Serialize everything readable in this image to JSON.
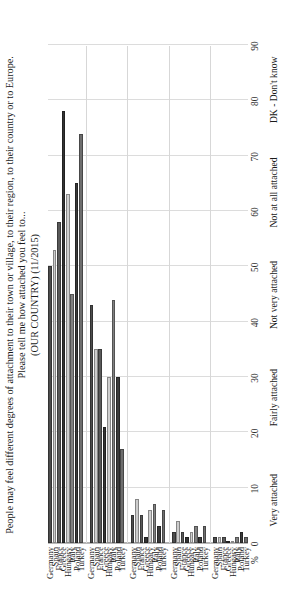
{
  "figure": {
    "title_line1": "People may feel different degrees of attachment to their town or village, to their region, to their country or to Europe.",
    "title_line2": "Please tell me how attached you feel to...",
    "title_line3": "(OUR COUNTRY) (11/2015)",
    "axis_unit_label": "%",
    "orientation": "rotated-90"
  },
  "chart_data": {
    "type": "bar",
    "subtitle": "(OUR COUNTRY) (11/2015)",
    "xlabel": "%",
    "ylabel": "",
    "orientation": "horizontal",
    "xlim": [
      0,
      90
    ],
    "xticks": [
      0,
      10,
      20,
      30,
      40,
      50,
      60,
      70,
      80,
      90
    ],
    "grid": true,
    "legend": "none",
    "categories": [
      "Very attached",
      "Fairly attached",
      "Not very attached",
      "Not at all attached",
      "DK - Don't know"
    ],
    "countries": [
      "Germany",
      "Spain",
      "France",
      "Greece",
      "Hungary",
      "Italy",
      "Poland",
      "Turkey"
    ],
    "groups": [
      {
        "label": "Very attached",
        "bars": [
          {
            "country": "Germany",
            "value": 50,
            "color": "#4d4d4d"
          },
          {
            "country": "Spain",
            "value": 53,
            "color": "#cccccc"
          },
          {
            "country": "France",
            "value": 58,
            "color": "#595959"
          },
          {
            "country": "Greece",
            "value": 78,
            "color": "#333333"
          },
          {
            "country": "Hungary",
            "value": 63,
            "color": "#cfcfcf"
          },
          {
            "country": "Italy",
            "value": 45,
            "color": "#808080"
          },
          {
            "country": "Poland",
            "value": 65,
            "color": "#3a3a3a"
          },
          {
            "country": "Turkey",
            "value": 74,
            "color": "#6e6e6e"
          }
        ]
      },
      {
        "label": "Fairly attached",
        "bars": [
          {
            "country": "Germany",
            "value": 43,
            "color": "#4d4d4d"
          },
          {
            "country": "Spain",
            "value": 35,
            "color": "#cccccc"
          },
          {
            "country": "France",
            "value": 35,
            "color": "#595959"
          },
          {
            "country": "Greece",
            "value": 21,
            "color": "#333333"
          },
          {
            "country": "Hungary",
            "value": 30,
            "color": "#cfcfcf"
          },
          {
            "country": "Italy",
            "value": 44,
            "color": "#808080"
          },
          {
            "country": "Poland",
            "value": 30,
            "color": "#3a3a3a"
          },
          {
            "country": "Turkey",
            "value": 17,
            "color": "#6e6e6e"
          }
        ]
      },
      {
        "label": "Not very attached",
        "bars": [
          {
            "country": "Germany",
            "value": 5,
            "color": "#4d4d4d"
          },
          {
            "country": "Spain",
            "value": 8,
            "color": "#cccccc"
          },
          {
            "country": "France",
            "value": 5,
            "color": "#595959"
          },
          {
            "country": "Greece",
            "value": 1,
            "color": "#333333"
          },
          {
            "country": "Hungary",
            "value": 6,
            "color": "#cfcfcf"
          },
          {
            "country": "Italy",
            "value": 7,
            "color": "#808080"
          },
          {
            "country": "Poland",
            "value": 3,
            "color": "#3a3a3a"
          },
          {
            "country": "Turkey",
            "value": 6,
            "color": "#6e6e6e"
          }
        ]
      },
      {
        "label": "Not at all attached",
        "bars": [
          {
            "country": "Germany",
            "value": 2,
            "color": "#4d4d4d"
          },
          {
            "country": "Spain",
            "value": 4,
            "color": "#cccccc"
          },
          {
            "country": "France",
            "value": 2,
            "color": "#595959"
          },
          {
            "country": "Greece",
            "value": 1,
            "color": "#333333"
          },
          {
            "country": "Hungary",
            "value": 2,
            "color": "#cfcfcf"
          },
          {
            "country": "Italy",
            "value": 3,
            "color": "#808080"
          },
          {
            "country": "Poland",
            "value": 1,
            "color": "#3a3a3a"
          },
          {
            "country": "Turkey",
            "value": 3,
            "color": "#6e6e6e"
          }
        ]
      },
      {
        "label": "DK - Don't know",
        "bars": [
          {
            "country": "Germany",
            "value": 1,
            "color": "#4d4d4d"
          },
          {
            "country": "Spain",
            "value": 1,
            "color": "#cccccc"
          },
          {
            "country": "France",
            "value": 1,
            "color": "#595959"
          },
          {
            "country": "Greece",
            "value": 0,
            "color": "#333333"
          },
          {
            "country": "Hungary",
            "value": 0,
            "color": "#cfcfcf"
          },
          {
            "country": "Italy",
            "value": 1,
            "color": "#808080"
          },
          {
            "country": "Poland",
            "value": 2,
            "color": "#3a3a3a"
          },
          {
            "country": "Turkey",
            "value": 1,
            "color": "#6e6e6e"
          }
        ]
      }
    ]
  }
}
